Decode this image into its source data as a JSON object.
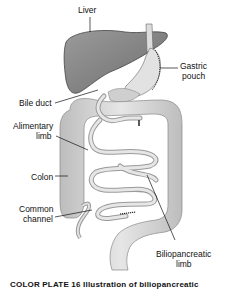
{
  "figure": {
    "labels": {
      "liver": "Liver",
      "gastric_pouch_1": "Gastric",
      "gastric_pouch_2": "pouch",
      "bile_duct": "Bile duct",
      "alimentary_limb_1": "Alimentary",
      "alimentary_limb_2": "limb",
      "colon": "Colon",
      "common_channel_1": "Common",
      "common_channel_2": "channel",
      "biliopancreatic_limb_1": "Biliopancreatic",
      "biliopancreatic_limb_2": "limb"
    },
    "caption": "COLOR PLATE 16  Illustration of biliopancreatic"
  },
  "colors": {
    "liver": "#8a8a8a",
    "intestine": "#d8d8d8",
    "outline": "#555555",
    "background": "#ffffff"
  }
}
